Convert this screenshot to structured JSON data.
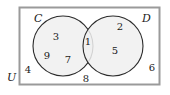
{
  "diagram": {
    "type": "venn-two-set",
    "universe_label": "U",
    "set_labels": {
      "left": "C",
      "right": "D"
    },
    "colors": {
      "circle_fill": "#f0f0f0",
      "circle_stroke": "#2b2b2b",
      "rect_stroke": "#9a9a9a",
      "rect_fill": "#ffffff",
      "text": "#1a1a1a"
    },
    "regions": [
      {
        "id": "left-only-top",
        "region": "C only",
        "value": "3"
      },
      {
        "id": "left-only-lower",
        "region": "C only",
        "value": "9"
      },
      {
        "id": "left-only-right",
        "region": "C only",
        "value": "7"
      },
      {
        "id": "intersection",
        "region": "C and D",
        "value": "1"
      },
      {
        "id": "right-only-top",
        "region": "D only",
        "value": "2"
      },
      {
        "id": "right-only-mid",
        "region": "D only",
        "value": "5"
      },
      {
        "id": "outside-left",
        "region": "outside C and D",
        "value": "4"
      },
      {
        "id": "outside-right",
        "region": "outside C and D",
        "value": "6"
      },
      {
        "id": "outside-bottom",
        "region": "outside C and D",
        "value": "8"
      }
    ]
  }
}
